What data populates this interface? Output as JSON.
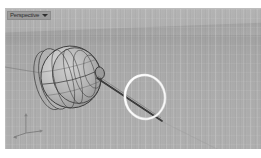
{
  "app": {
    "kind": "3d-modeling-viewport"
  },
  "viewport": {
    "title": "Perspective",
    "title_dropdown_icon": "chevron-down-icon",
    "display_mode": "Shaded",
    "background_sky_color": "#b3b3b3",
    "background_ground_color": "#a9a9a9",
    "grid_visible": true,
    "horizon_visible": true
  },
  "axis_gizmo": {
    "name": "world-axis-indicator",
    "x_label": "x",
    "y_label": "y",
    "z_label": "z"
  },
  "scene": {
    "objects": [
      {
        "name": "ellipsoid-cluster",
        "type": "surface",
        "description": "Shaded ellipsoid body with wireframe isocurves",
        "fill_color": "#b9b9b9",
        "wire_color": "#3b3b3b"
      },
      {
        "name": "rod",
        "type": "curve",
        "description": "Thin straight rod running from the ellipsoid through the ring",
        "color": "#2e2e2e"
      },
      {
        "name": "ring-curve",
        "type": "curve",
        "description": "White highlighted circular curve (selected)",
        "color": "#f2f2f2"
      },
      {
        "name": "axis-line",
        "type": "curve",
        "description": "Faint construction line extending to the left",
        "color": "#6b6b6b"
      }
    ]
  }
}
